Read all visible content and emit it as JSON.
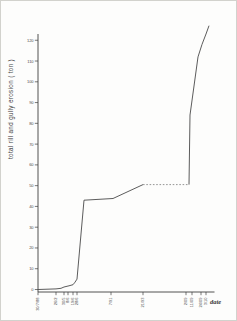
{
  "page": {
    "kind": "scanned figure of a cumulative erosion line chart",
    "paper_color": "#fdfdfc",
    "border_color": "#d2d2cd",
    "axis_color": "#3f3f3f",
    "line_color": "#4a4a4a",
    "dashed_color": "#7a7a7a"
  },
  "chart_data": {
    "type": "line",
    "title": "",
    "ylabel": "total  rill  and  gully  erosion   ( ton )",
    "xlabel": "date",
    "ylim": [
      0,
      130
    ],
    "grid": false,
    "legend": false,
    "y_ticks": [
      0,
      10,
      20,
      30,
      40,
      50,
      60,
      70,
      80,
      90,
      100,
      110,
      120
    ],
    "x_axis_note": "irregular survey dates, labels rotated vertically",
    "x_ticks": [
      {
        "px": 37,
        "label": "30/7/88"
      },
      {
        "px": 55,
        "label": "26/2"
      },
      {
        "px": 63,
        "label": "30/5"
      },
      {
        "px": 67,
        "label": "8/6"
      },
      {
        "px": 72,
        "label": "19/6"
      },
      {
        "px": 76,
        "label": "28/6"
      },
      {
        "px": 110,
        "label": "7/91"
      },
      {
        "px": 142,
        "label": "21/93"
      },
      {
        "px": 185,
        "label": "2/09"
      },
      {
        "px": 191,
        "label": "11/09"
      },
      {
        "px": 200,
        "label": "24/09"
      },
      {
        "px": 205,
        "label": "3/10"
      }
    ],
    "series": [
      {
        "name": "cumulative rill and gully erosion",
        "style_note": "solid line; plateau between 21/93 and 2/09 drawn dashed",
        "points": [
          {
            "x_px": 37,
            "tons": 0
          },
          {
            "x_px": 55,
            "tons": 0.3
          },
          {
            "x_px": 60,
            "tons": 0.6
          },
          {
            "x_px": 63,
            "tons": 1.2
          },
          {
            "x_px": 68,
            "tons": 1.8
          },
          {
            "x_px": 72,
            "tons": 2.3
          },
          {
            "x_px": 74,
            "tons": 3.5
          },
          {
            "x_px": 76,
            "tons": 5
          },
          {
            "x_px": 83,
            "tons": 43
          },
          {
            "x_px": 112,
            "tons": 43.8
          },
          {
            "x_px": 142,
            "tons": 50.5,
            "dash_to_next": true
          },
          {
            "x_px": 188,
            "tons": 50.5
          },
          {
            "x_px": 189,
            "tons": 84
          },
          {
            "x_px": 193,
            "tons": 98
          },
          {
            "x_px": 197,
            "tons": 112
          },
          {
            "x_px": 201,
            "tons": 118
          },
          {
            "x_px": 205,
            "tons": 123
          },
          {
            "x_px": 208,
            "tons": 127
          }
        ]
      }
    ]
  }
}
